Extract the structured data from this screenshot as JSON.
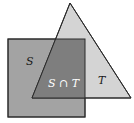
{
  "diagram": {
    "type": "venn-shapes",
    "shapes": [
      {
        "name": "S",
        "shape": "square",
        "fill": "#a3a3a3"
      },
      {
        "name": "T",
        "shape": "triangle",
        "fill": "#d4d4d4"
      }
    ],
    "labels": {
      "S": "S",
      "T": "T",
      "intersection": "S ∩ T"
    },
    "colors": {
      "square": "#a3a3a3",
      "triangle": "#d4d4d4",
      "intersection": "#7e7e7e",
      "outline": "#2a2a2a",
      "intersection_label": "#ffffff"
    }
  }
}
